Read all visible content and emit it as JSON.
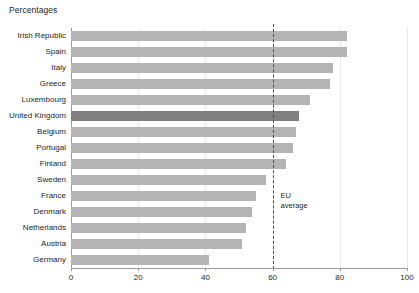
{
  "chart_data": {
    "type": "bar",
    "orientation": "horizontal",
    "title": "Percentages",
    "xlabel": "",
    "ylabel": "",
    "xlim": [
      0,
      100
    ],
    "xticks": [
      0,
      20,
      40,
      60,
      80,
      100
    ],
    "grid": true,
    "legend": null,
    "highlight_category": "United Kingdom",
    "colors": {
      "bar": "#b4b4b4",
      "bar_highlight": "#808080",
      "axis": "#9a9a9a",
      "gridline": "#e9e9e9",
      "reference_line": "#4d4d4d",
      "text": "#231f20"
    },
    "annotations": [
      {
        "name": "eu-average",
        "label_line1": "EU",
        "label_line2": "average",
        "value": 60,
        "style": "dashed-vertical"
      }
    ],
    "categories": [
      "Irish Republic",
      "Spain",
      "Italy",
      "Greece",
      "Luxembourg",
      "United Kingdom",
      "Belgium",
      "Portugal",
      "Finland",
      "Sweden",
      "France",
      "Denmark",
      "Netherlands",
      "Austria",
      "Germany"
    ],
    "values": [
      82,
      82,
      78,
      77,
      71,
      68,
      67,
      66,
      64,
      58,
      55,
      54,
      52,
      51,
      41
    ]
  }
}
